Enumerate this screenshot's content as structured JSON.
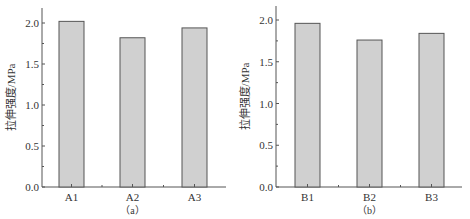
{
  "chart_data": [
    {
      "type": "bar",
      "panel_label": "（a）",
      "title": "",
      "xlabel": "",
      "ylabel": "拉伸强度/MPa",
      "categories": [
        "A1",
        "A2",
        "A3"
      ],
      "values": [
        2.02,
        1.82,
        1.94
      ],
      "ylim": [
        0,
        2.2
      ],
      "yticks": [
        "0.0",
        "0.5",
        "1.0",
        "1.5",
        "2.0"
      ],
      "grid": false,
      "legend": null,
      "bar_color": "#d0d0d0",
      "bar_edge_color": "#555555"
    },
    {
      "type": "bar",
      "panel_label": "（b）",
      "title": "",
      "xlabel": "",
      "ylabel": "拉伸强度/MPa",
      "categories": [
        "B1",
        "B2",
        "B3"
      ],
      "values": [
        1.96,
        1.76,
        1.84
      ],
      "ylim": [
        0,
        2.2
      ],
      "yticks": [
        "0.0",
        "0.5",
        "1.0",
        "1.5",
        "2.0"
      ],
      "grid": false,
      "legend": null,
      "bar_color": "#d0d0d0",
      "bar_edge_color": "#555555"
    }
  ]
}
